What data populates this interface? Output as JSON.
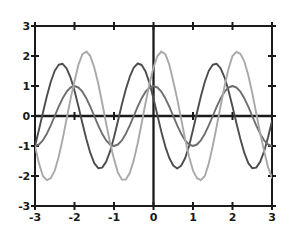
{
  "chart_data": {
    "type": "line",
    "title": "",
    "subtitle": "",
    "xlabel": "",
    "ylabel": "",
    "xlim": [
      -3,
      3
    ],
    "ylim": [
      -3,
      3
    ],
    "xticks": [
      -3,
      -2,
      -1,
      0,
      1,
      2,
      3
    ],
    "yticks": [
      -3,
      -2,
      -1,
      0,
      1,
      2,
      3
    ],
    "xtick_labels": [
      "-3",
      "-2",
      "-1",
      "0",
      "1",
      "2",
      "3"
    ],
    "ytick_labels": [
      "-3",
      "-2",
      "-1",
      "0",
      "1",
      "2",
      "3"
    ],
    "grid": false,
    "legend": "none",
    "axes_frame": "box",
    "zero_axes_drawn": true,
    "colors": {
      "frame": "#1a1a1a",
      "axis": "#1a1a1a",
      "curve_dark": "#4d4d4d",
      "curve_mid": "#6e6e6e",
      "curve_light": "#a8a8a8",
      "background": "#ffffff",
      "tick_text": "#1a1a1a"
    },
    "series": [
      {
        "name": "curve-dark",
        "color": "#4d4d4d",
        "amplitude": 1.75,
        "period": 2,
        "phase": 0.35,
        "formula": "1.75*cos(pi*(x+0.35))",
        "x": [
          -3,
          -2.9,
          -2.8,
          -2.7,
          -2.6,
          -2.5,
          -2.4,
          -2.3,
          -2.2,
          -2.1,
          -2,
          -1.9,
          -1.8,
          -1.7,
          -1.6,
          -1.5,
          -1.4,
          -1.3,
          -1.2,
          -1.1,
          -1,
          -0.9,
          -0.8,
          -0.7,
          -0.6,
          -0.5,
          -0.4,
          -0.3,
          -0.2,
          -0.1,
          0,
          0.1,
          0.2,
          0.3,
          0.4,
          0.5,
          0.6,
          0.7,
          0.8,
          0.9,
          1,
          1.1,
          1.2,
          1.3,
          1.4,
          1.5,
          1.6,
          1.7,
          1.8,
          1.9,
          2,
          2.1,
          2.2,
          2.3,
          2.4,
          2.5,
          2.6,
          2.7,
          2.8,
          2.9,
          3
        ],
        "y": [
          -1,
          -0.46,
          0.11,
          0.66,
          1.14,
          1.51,
          1.71,
          1.74,
          1.59,
          1.28,
          0.84,
          0.32,
          -0.24,
          -0.77,
          -1.23,
          -1.57,
          -1.74,
          -1.72,
          -1.53,
          -1.18,
          -0.71,
          -0.17,
          0.39,
          0.89,
          1.31,
          1.61,
          1.75,
          1.7,
          1.48,
          1.09,
          0.58,
          0.02,
          -0.53,
          -1.02,
          -1.4,
          -1.65,
          -1.75,
          -1.66,
          -1.41,
          -1,
          -0.46,
          0.11,
          0.66,
          1.14,
          1.51,
          1.71,
          1.74,
          1.59,
          1.28,
          0.84,
          0.32,
          -0.24,
          -0.77,
          -1.23,
          -1.57,
          -1.74,
          -1.72,
          -1.53,
          -1.18,
          -0.71,
          -0.17
        ]
      },
      {
        "name": "curve-mid",
        "color": "#6e6e6e",
        "amplitude": 1,
        "period": 2,
        "phase": 0,
        "formula": "cos(pi*x)",
        "x": [
          -3,
          -2.9,
          -2.8,
          -2.7,
          -2.6,
          -2.5,
          -2.4,
          -2.3,
          -2.2,
          -2.1,
          -2,
          -1.9,
          -1.8,
          -1.7,
          -1.6,
          -1.5,
          -1.4,
          -1.3,
          -1.2,
          -1.1,
          -1,
          -0.9,
          -0.8,
          -0.7,
          -0.6,
          -0.5,
          -0.4,
          -0.3,
          -0.2,
          -0.1,
          0,
          0.1,
          0.2,
          0.3,
          0.4,
          0.5,
          0.6,
          0.7,
          0.8,
          0.9,
          1,
          1.1,
          1.2,
          1.3,
          1.4,
          1.5,
          1.6,
          1.7,
          1.8,
          1.9,
          2,
          2.1,
          2.2,
          2.3,
          2.4,
          2.5,
          2.6,
          2.7,
          2.8,
          2.9,
          3
        ],
        "y": [
          -1,
          -0.95,
          -0.81,
          -0.59,
          -0.31,
          0,
          0.31,
          0.59,
          0.81,
          0.95,
          1,
          0.95,
          0.81,
          0.59,
          0.31,
          0,
          -0.31,
          -0.59,
          -0.81,
          -0.95,
          -1,
          -0.95,
          -0.81,
          -0.59,
          -0.31,
          0,
          0.31,
          0.59,
          0.81,
          0.95,
          1,
          0.95,
          0.81,
          0.59,
          0.31,
          0,
          -0.31,
          -0.59,
          -0.81,
          -0.95,
          -1,
          -0.95,
          -0.81,
          -0.59,
          -0.31,
          0,
          0.31,
          0.59,
          0.81,
          0.95,
          1,
          0.95,
          0.81,
          0.59,
          0.31,
          0,
          -0.31,
          -0.59,
          -0.81,
          -0.95,
          -1
        ]
      },
      {
        "name": "curve-light",
        "color": "#a8a8a8",
        "amplitude": 2.15,
        "period": 2,
        "phase": -0.45,
        "formula": "2.15*cos(pi*(x-0.45))",
        "x": [
          -3,
          -2.9,
          -2.8,
          -2.7,
          -2.6,
          -2.5,
          -2.4,
          -2.3,
          -2.2,
          -2.1,
          -2,
          -1.9,
          -1.8,
          -1.7,
          -1.6,
          -1.5,
          -1.4,
          -1.3,
          -1.2,
          -1.1,
          -1,
          -0.9,
          -0.8,
          -0.7,
          -0.6,
          -0.5,
          -0.4,
          -0.3,
          -0.2,
          -0.1,
          0,
          0.1,
          0.2,
          0.3,
          0.4,
          0.5,
          0.6,
          0.7,
          0.8,
          0.9,
          1,
          1.1,
          1.2,
          1.3,
          1.4,
          1.5,
          1.6,
          1.7,
          1.8,
          1.9,
          2,
          2.1,
          2.2,
          2.3,
          2.4,
          2.5,
          2.6,
          2.7,
          2.8,
          2.9,
          3
        ],
        "y": [
          -1,
          -1.58,
          -2,
          -2.14,
          -2.07,
          -1.82,
          -1.36,
          -0.77,
          -0.1,
          0.57,
          1.16,
          1.71,
          2.06,
          2.15,
          2,
          1.62,
          1.09,
          0.44,
          -0.24,
          -0.89,
          -1.43,
          -1.89,
          -2.12,
          -2.12,
          -1.9,
          -1.48,
          -0.91,
          -0.24,
          0.44,
          1.09,
          1.62,
          2,
          2.15,
          2.06,
          1.71,
          1.16,
          0.57,
          -0.1,
          -0.77,
          -1.36,
          -1.82,
          -2.07,
          -2.14,
          -2,
          -1.58,
          -1.0,
          -0.34,
          0.34,
          1,
          1.58,
          2,
          2.14,
          2.07,
          1.82,
          1.36,
          0.77,
          0.1,
          -0.57,
          -1.16,
          -1.71,
          -2.06
        ]
      }
    ],
    "shared_crossings": [
      {
        "x": -3,
        "y": -1
      },
      {
        "x": -2,
        "y": 1
      },
      {
        "x": -1,
        "y": -1
      },
      {
        "x": 0,
        "y": 1
      },
      {
        "x": 1,
        "y": -1
      },
      {
        "x": 2,
        "y": 1
      },
      {
        "x": 3,
        "y": -1
      }
    ]
  }
}
